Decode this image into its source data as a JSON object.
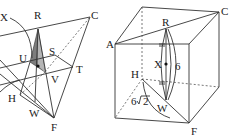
{
  "figures": [
    {
      "name": "octahedron-cross-section",
      "labels": {
        "X": "X",
        "R": "R",
        "C": "C",
        "U": "U",
        "S": "S",
        "T": "T",
        "V": "V",
        "H": "H",
        "W": "W",
        "F": "F"
      },
      "shaded_color": "#888888"
    },
    {
      "name": "cube-diagram",
      "labels": {
        "A": "A",
        "R": "R",
        "C": "C",
        "X": "X",
        "H": "H",
        "W": "W",
        "F": "F"
      },
      "measurements": {
        "RW": "6",
        "HW": "6√2",
        "HW_coef": "6",
        "HW_rad": "2"
      }
    }
  ]
}
